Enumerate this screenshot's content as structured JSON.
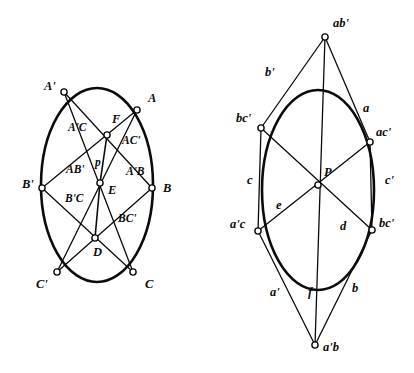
{
  "figure": {
    "background_color": "#ffffff",
    "ink_color": "#0b0b0b",
    "conic_stroke_width": 2.6,
    "chord_stroke_width": 1.3,
    "vertex_marker": {
      "shape": "open-circle",
      "radius": 3.1,
      "fill": "#ffffff",
      "stroke": "#0b0b0b"
    }
  },
  "left_diagram": {
    "name": "pascal-inscribed-hexagon",
    "conic": {
      "cx": 97,
      "cy": 185,
      "rx": 56,
      "ry": 97,
      "type": "ellipse"
    },
    "vertices": [
      {
        "id": "Aprime",
        "label": "A'",
        "x": 64,
        "y": 92,
        "label_x": 44,
        "label_y": 90
      },
      {
        "id": "A",
        "label": "A",
        "x": 137,
        "y": 110,
        "label_x": 148,
        "label_y": 102
      },
      {
        "id": "Bprime",
        "label": "B'",
        "x": 42,
        "y": 188,
        "label_x": 22,
        "label_y": 188
      },
      {
        "id": "B",
        "label": "B",
        "x": 152,
        "y": 188,
        "label_x": 163,
        "label_y": 192
      },
      {
        "id": "Cprime",
        "label": "C'",
        "x": 57,
        "y": 272,
        "label_x": 36,
        "label_y": 288
      },
      {
        "id": "C",
        "label": "C",
        "x": 133,
        "y": 272,
        "label_x": 145,
        "label_y": 288
      }
    ],
    "intersections": [
      {
        "id": "F",
        "label": "F",
        "x": 107,
        "y": 135,
        "label_x": 112,
        "label_y": 123
      },
      {
        "id": "E",
        "label": "E",
        "x": 100,
        "y": 183,
        "label_x": 108,
        "label_y": 194
      },
      {
        "id": "D",
        "label": "D",
        "x": 95,
        "y": 238,
        "label_x": 93,
        "label_y": 256
      }
    ],
    "segment_labels": [
      {
        "id": "A-prime-C",
        "label": "A'C",
        "x": 68,
        "y": 131
      },
      {
        "id": "A-C-prime",
        "label": "AC'",
        "x": 122,
        "y": 144
      },
      {
        "id": "A-B-prime",
        "label": "AB'",
        "x": 66,
        "y": 173
      },
      {
        "id": "A-prime-B",
        "label": "A'B",
        "x": 126,
        "y": 175
      },
      {
        "id": "B-prime-C",
        "label": "B'C",
        "x": 65,
        "y": 202
      },
      {
        "id": "B-C-prime",
        "label": "BC'",
        "x": 118,
        "y": 222
      },
      {
        "id": "pascal-line-p",
        "label": "p",
        "x": 95,
        "y": 166
      }
    ],
    "chords": [
      [
        "Aprime",
        "B"
      ],
      [
        "Aprime",
        "C"
      ],
      [
        "A",
        "Bprime"
      ],
      [
        "A",
        "Cprime"
      ],
      [
        "Bprime",
        "C"
      ],
      [
        "B",
        "Cprime"
      ]
    ],
    "pascal_line": {
      "from": "F",
      "to": "D",
      "through": "E"
    }
  },
  "right_diagram": {
    "name": "brianchon-circumscribed-hexagon",
    "conic": {
      "cx": 318,
      "cy": 190,
      "rx": 56,
      "ry": 100,
      "type": "ellipse"
    },
    "vertices": [
      {
        "id": "abprime",
        "label": "ab'",
        "x": 325,
        "y": 37,
        "label_x": 333,
        "label_y": 27
      },
      {
        "id": "bcprime_u",
        "label": "bc'",
        "x": 261,
        "y": 128,
        "label_x": 236,
        "label_y": 122
      },
      {
        "id": "acprime",
        "label": "ac'",
        "x": 370,
        "y": 142,
        "label_x": 376,
        "label_y": 136
      },
      {
        "id": "aprimec",
        "label": "a'c",
        "x": 258,
        "y": 231,
        "label_x": 230,
        "label_y": 228
      },
      {
        "id": "bcprime_l",
        "label": "bc'",
        "x": 372,
        "y": 230,
        "label_x": 379,
        "label_y": 227
      },
      {
        "id": "aprimeb",
        "label": "a'b",
        "x": 315,
        "y": 345,
        "label_x": 323,
        "label_y": 351
      }
    ],
    "center": {
      "id": "P",
      "label": "P",
      "x": 318,
      "y": 185,
      "label_x": 324,
      "label_y": 176
    },
    "tangent_labels": [
      {
        "id": "b-prime",
        "label": "b'",
        "x": 265,
        "y": 76
      },
      {
        "id": "a",
        "label": "a",
        "x": 363,
        "y": 112
      },
      {
        "id": "c",
        "label": "c",
        "x": 247,
        "y": 184
      },
      {
        "id": "c-prime",
        "label": "c'",
        "x": 385,
        "y": 184
      },
      {
        "id": "e",
        "label": "e",
        "x": 276,
        "y": 209
      },
      {
        "id": "d",
        "label": "d",
        "x": 340,
        "y": 230
      },
      {
        "id": "a-prime",
        "label": "a'",
        "x": 270,
        "y": 296
      },
      {
        "id": "f",
        "label": "f",
        "x": 308,
        "y": 296
      },
      {
        "id": "b",
        "label": "b",
        "x": 352,
        "y": 292
      }
    ],
    "sides": [
      [
        "abprime",
        "bcprime_u"
      ],
      [
        "abprime",
        "acprime"
      ],
      [
        "bcprime_u",
        "aprimec"
      ],
      [
        "acprime",
        "bcprime_l"
      ],
      [
        "aprimec",
        "aprimeb"
      ],
      [
        "bcprime_l",
        "aprimeb"
      ]
    ],
    "diagonals": [
      [
        "abprime",
        "aprimeb"
      ],
      [
        "bcprime_u",
        "bcprime_l"
      ],
      [
        "acprime",
        "aprimec"
      ]
    ]
  }
}
